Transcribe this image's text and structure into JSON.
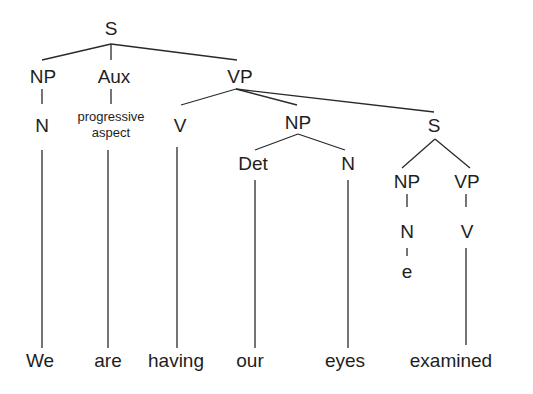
{
  "diagram": {
    "type": "syntax-tree",
    "nodes": {
      "s_root": "S",
      "np1": "NP",
      "aux": "Aux",
      "vp1": "VP",
      "n1": "N",
      "aux_feature_line1": "progressive",
      "aux_feature_line2": "aspect",
      "v1": "V",
      "np2": "NP",
      "det": "Det",
      "n2": "N",
      "s_embedded": "S",
      "np3": "NP",
      "vp2": "VP",
      "n3": "N",
      "empty": "e",
      "v2": "V"
    },
    "words": [
      "We",
      "are",
      "having",
      "our",
      "eyes",
      "examined"
    ]
  }
}
